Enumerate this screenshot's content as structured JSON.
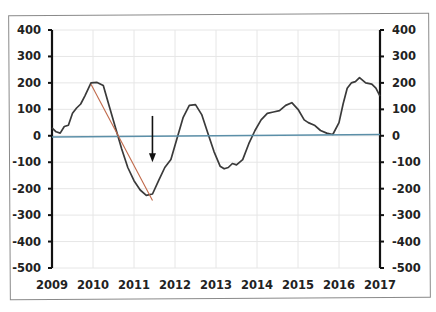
{
  "chart_data": {
    "type": "line",
    "title": "",
    "xlabel": "",
    "ylabel": "",
    "x_ticks": [
      "2009",
      "2010",
      "2011",
      "2012",
      "2013",
      "2014",
      "2015",
      "2016",
      "2017"
    ],
    "y_ticks_left": [
      "400",
      "300",
      "200",
      "100",
      "0",
      "-100",
      "-200",
      "-300",
      "-400",
      "-500"
    ],
    "y_ticks_right": [
      "400",
      "300",
      "200",
      "100",
      "0",
      "-100",
      "-200",
      "-300",
      "-400",
      "-500"
    ],
    "xlim": [
      2009,
      2017
    ],
    "ylim": [
      -500,
      400
    ],
    "grid": true,
    "legend": null,
    "series": [
      {
        "name": "main-series",
        "color": "#3a3a3a",
        "x": [
          2009.0,
          2009.1,
          2009.2,
          2009.3,
          2009.4,
          2009.5,
          2009.6,
          2009.7,
          2009.8,
          2009.95,
          2010.1,
          2010.25,
          2010.4,
          2010.55,
          2010.7,
          2010.85,
          2011.0,
          2011.15,
          2011.3,
          2011.45,
          2011.6,
          2011.75,
          2011.9,
          2012.05,
          2012.2,
          2012.35,
          2012.5,
          2012.65,
          2012.8,
          2012.95,
          2013.1,
          2013.2,
          2013.3,
          2013.4,
          2013.5,
          2013.65,
          2013.8,
          2013.95,
          2014.1,
          2014.25,
          2014.4,
          2014.55,
          2014.7,
          2014.85,
          2015.0,
          2015.15,
          2015.25,
          2015.4,
          2015.55,
          2015.7,
          2015.85,
          2016.0,
          2016.1,
          2016.2,
          2016.3,
          2016.4,
          2016.5,
          2016.65,
          2016.8,
          2016.9,
          2017.0
        ],
        "values": [
          30,
          15,
          10,
          35,
          40,
          85,
          105,
          120,
          150,
          200,
          202,
          190,
          110,
          30,
          -50,
          -120,
          -170,
          -205,
          -225,
          -220,
          -170,
          -120,
          -90,
          -10,
          70,
          115,
          118,
          80,
          10,
          -60,
          -115,
          -125,
          -120,
          -105,
          -110,
          -90,
          -30,
          20,
          60,
          85,
          90,
          95,
          115,
          125,
          100,
          60,
          50,
          40,
          20,
          10,
          5,
          50,
          120,
          180,
          200,
          205,
          220,
          200,
          195,
          180,
          150
        ]
      },
      {
        "name": "zero-trend-line",
        "color": "#5b8fa8",
        "x": [
          2009.0,
          2017.0
        ],
        "values": [
          -5,
          5
        ]
      },
      {
        "name": "decline-trend-line",
        "color": "#c0694a",
        "x": [
          2009.95,
          2011.45
        ],
        "values": [
          195,
          -245
        ]
      }
    ],
    "annotations": [
      {
        "type": "arrow-down",
        "x": 2011.45,
        "y_from": 75,
        "y_to": -100,
        "color": "#111111"
      }
    ]
  }
}
